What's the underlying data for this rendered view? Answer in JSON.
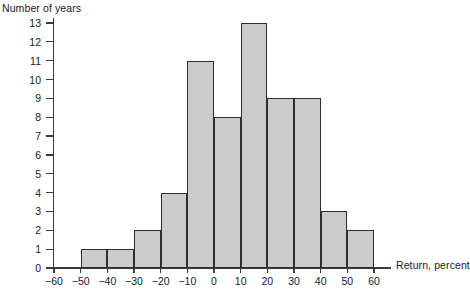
{
  "chart": {
    "ylabel_title": "Number of years",
    "xlabel_title": "Return, percent"
  },
  "chart_data": {
    "type": "bar",
    "title": "",
    "subtitle": "",
    "xlabel": "Return, percent",
    "ylabel": "Number of years",
    "xlim": [
      -60,
      60
    ],
    "ylim": [
      0,
      13
    ],
    "grid": false,
    "legend": null,
    "bin_width": 10,
    "bin_edges": [
      -60,
      -50,
      -40,
      -30,
      -20,
      -10,
      0,
      10,
      20,
      30,
      40,
      50,
      60
    ],
    "categories": [
      "-60 to -50",
      "-50 to -40",
      "-40 to -30",
      "-30 to -20",
      "-20 to -10",
      "-10 to 0",
      "0 to 10",
      "10 to 20",
      "20 to 30",
      "30 to 40",
      "40 to 50",
      "50 to 60"
    ],
    "values": [
      0,
      1,
      1,
      2,
      4,
      11,
      8,
      13,
      9,
      9,
      3,
      2
    ],
    "xticks": [
      -60,
      -50,
      -40,
      -30,
      -20,
      -10,
      0,
      10,
      20,
      30,
      40,
      50,
      60
    ],
    "xtick_labels": [
      "−60",
      "−50",
      "−40",
      "−30",
      "−20",
      "−10",
      "0",
      "10",
      "20",
      "30",
      "40",
      "50",
      "60"
    ],
    "yticks": [
      0,
      1,
      2,
      3,
      4,
      5,
      6,
      7,
      8,
      9,
      10,
      11,
      12,
      13
    ],
    "ytick_labels": [
      "0",
      "1",
      "2",
      "3",
      "4",
      "5",
      "6",
      "7",
      "8",
      "9",
      "10",
      "11",
      "12",
      "13"
    ],
    "bar_fill_color": "#cccccc",
    "bar_edge_color": "#2e2e2e",
    "axis_color": "#3a3a3a",
    "background_color": "#ffffff"
  }
}
